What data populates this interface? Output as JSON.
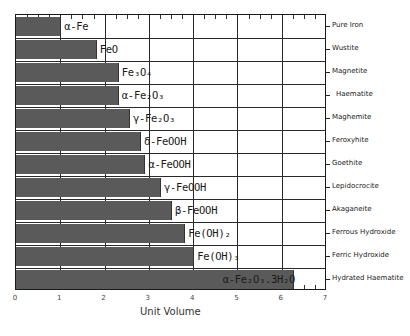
{
  "chart_data": {
    "type": "bar",
    "orientation": "horizontal",
    "title": "",
    "xlabel": "Unit Volume",
    "ylabel": "",
    "xlim": [
      0,
      7
    ],
    "xticks": [
      "0",
      "1",
      "2",
      "3",
      "4",
      "5",
      "6",
      "7"
    ],
    "grid": true,
    "categories": [
      "α-Fe",
      "FeO",
      "Fe₃O₄",
      "α-Fe₂O₃",
      "γ-Fe₂O₃",
      "δ-FeOOH",
      "α-FeOOH",
      "γ-FeOOH",
      "β-FeOOH",
      "Fe(OH)₂",
      "Fe(OH)₃",
      "α-Fe₂O₃.3H₂O"
    ],
    "mineral_names": [
      "Pure Iron",
      "Wustite",
      "Magnetite",
      "Haematite",
      "Maghemite",
      "Feroxyhite",
      "Goethite",
      "Lepidocrocite",
      "Akaganeite",
      "Ferrous Hydroxide",
      "Ferric Hydroxide",
      "Hydrated Haematite"
    ],
    "values": [
      1.0,
      1.8,
      2.3,
      2.3,
      2.55,
      2.8,
      2.9,
      3.25,
      3.5,
      3.8,
      4.0,
      6.25
    ],
    "bar_color": "#5a5a5a"
  },
  "labels": {
    "xlabel": "Unit Volume",
    "xticks": [
      "0",
      "1",
      "2",
      "3",
      "4",
      "5",
      "6",
      "7"
    ],
    "bars": [
      "α-Fe",
      "FeO",
      "Fe₃O₄",
      "α-Fe₂O₃",
      "γ-Fe₂O₃",
      "δ-FeOOH",
      "α-FeOOH",
      "γ-FeOOH",
      "β-FeOOH",
      "Fe(OH)₂",
      "Fe(OH)₃",
      "α-Fe₂O₃.3H₂O"
    ],
    "minerals": [
      "Pure Iron",
      "Wustite",
      "Magnetite",
      "Haematite",
      "Maghemite",
      "Feroxyhite",
      "Goethite",
      "Lepidocrocite",
      "Akaganeite",
      "Ferrous Hydroxide",
      "Ferric Hydroxide",
      "Hydrated Haematite"
    ]
  }
}
